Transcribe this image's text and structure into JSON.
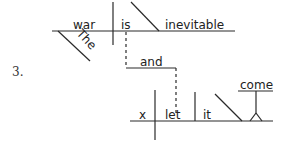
{
  "item_number": "3.",
  "main_clause": {
    "subject": "war",
    "verb": "is",
    "predicate_adjective": "inevitable",
    "modifier": "The"
  },
  "conjunction": "and",
  "second_clause": {
    "subject": "x",
    "verb": "let",
    "object": "it",
    "object_complement_infinitive": "come"
  },
  "colors": {
    "ink": "#2a2a2a",
    "background": "#ffffff"
  }
}
